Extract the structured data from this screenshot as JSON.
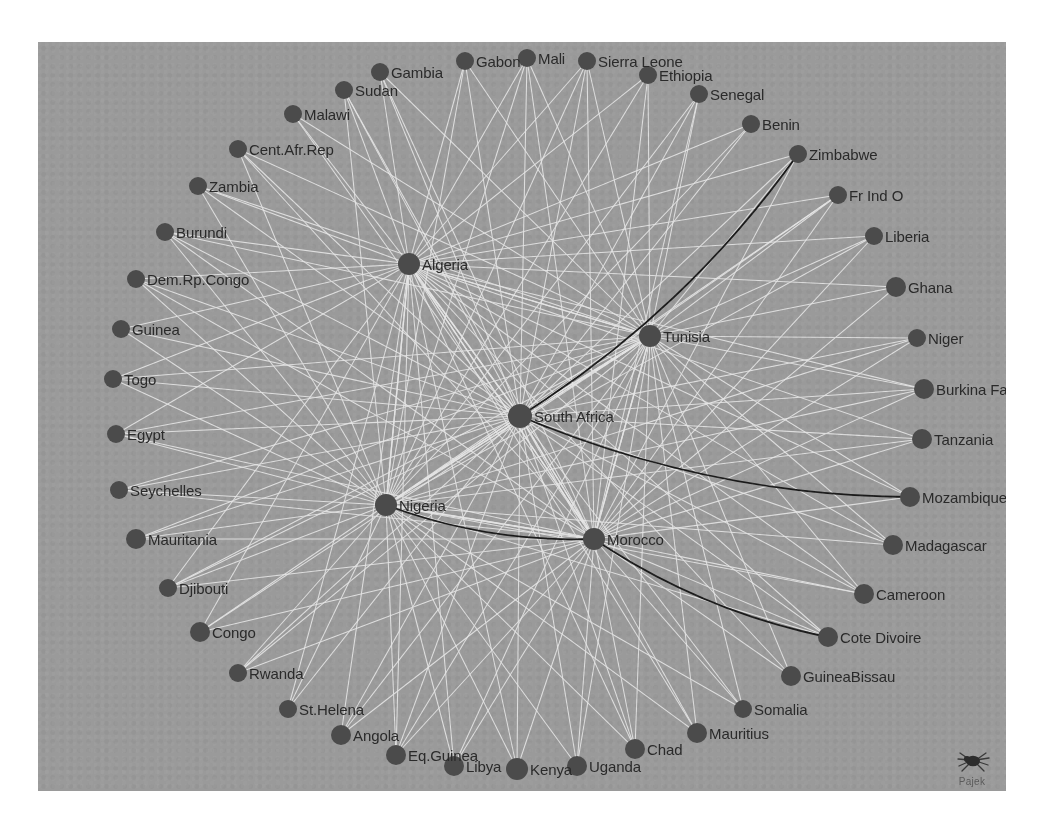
{
  "figure": {
    "kind": "network-graph",
    "software_watermark": "Pajek",
    "background_color": "#9a9a9a",
    "node_color": "#4b4b4b",
    "edge_color": "#e8e8e8",
    "highlight_edge_color": "#1a1a1a",
    "label_color": "#2a2a2a",
    "panel": {
      "x": 38,
      "y": 42,
      "width": 968,
      "height": 749
    }
  },
  "chart_data": {
    "type": "scatter",
    "title": "",
    "xlabel": "",
    "ylabel": "",
    "nodes": [
      {
        "label": "Gambia",
        "x": 342,
        "y": 30,
        "r": 9,
        "label_side": "right"
      },
      {
        "label": "Gabon",
        "x": 427,
        "y": 19,
        "r": 9,
        "label_side": "right"
      },
      {
        "label": "Mali",
        "x": 489,
        "y": 16,
        "r": 9,
        "label_side": "right"
      },
      {
        "label": "Sierra Leone",
        "x": 549,
        "y": 19,
        "r": 9,
        "label_side": "right"
      },
      {
        "label": "Ethiopia",
        "x": 610,
        "y": 33,
        "r": 9,
        "label_side": "right"
      },
      {
        "label": "Sudan",
        "x": 306,
        "y": 48,
        "r": 9,
        "label_side": "right"
      },
      {
        "label": "Senegal",
        "x": 661,
        "y": 52,
        "r": 9,
        "label_side": "right"
      },
      {
        "label": "Malawi",
        "x": 255,
        "y": 72,
        "r": 9,
        "label_side": "right"
      },
      {
        "label": "Benin",
        "x": 713,
        "y": 82,
        "r": 9,
        "label_side": "right"
      },
      {
        "label": "Cent.Afr.Rep",
        "x": 200,
        "y": 107,
        "r": 9,
        "label_side": "right"
      },
      {
        "label": "Zimbabwe",
        "x": 760,
        "y": 112,
        "r": 9,
        "label_side": "right"
      },
      {
        "label": "Zambia",
        "x": 160,
        "y": 144,
        "r": 9,
        "label_side": "right"
      },
      {
        "label": "Fr Ind O",
        "x": 800,
        "y": 153,
        "r": 9,
        "label_side": "right"
      },
      {
        "label": "Burundi",
        "x": 127,
        "y": 190,
        "r": 9,
        "label_side": "right"
      },
      {
        "label": "Liberia",
        "x": 836,
        "y": 194,
        "r": 9,
        "label_side": "right"
      },
      {
        "label": "Dem.Rp.Congo",
        "x": 98,
        "y": 237,
        "r": 9,
        "label_side": "right"
      },
      {
        "label": "Algeria",
        "x": 371,
        "y": 222,
        "r": 11,
        "label_side": "right"
      },
      {
        "label": "Ghana",
        "x": 858,
        "y": 245,
        "r": 10,
        "label_side": "right"
      },
      {
        "label": "Guinea",
        "x": 83,
        "y": 287,
        "r": 9,
        "label_side": "right"
      },
      {
        "label": "Niger",
        "x": 879,
        "y": 296,
        "r": 9,
        "label_side": "right"
      },
      {
        "label": "Tunisia",
        "x": 612,
        "y": 294,
        "r": 11,
        "label_side": "right"
      },
      {
        "label": "Togo",
        "x": 75,
        "y": 337,
        "r": 9,
        "label_side": "right"
      },
      {
        "label": "Burkina Faso",
        "x": 886,
        "y": 347,
        "r": 10,
        "label_side": "right"
      },
      {
        "label": "Egypt",
        "x": 78,
        "y": 392,
        "r": 9,
        "label_side": "right"
      },
      {
        "label": "South Africa",
        "x": 482,
        "y": 374,
        "r": 12,
        "label_side": "right"
      },
      {
        "label": "Tanzania",
        "x": 884,
        "y": 397,
        "r": 10,
        "label_side": "right"
      },
      {
        "label": "Seychelles",
        "x": 81,
        "y": 448,
        "r": 9,
        "label_side": "right"
      },
      {
        "label": "Mozambique",
        "x": 872,
        "y": 455,
        "r": 10,
        "label_side": "right"
      },
      {
        "label": "Nigeria",
        "x": 348,
        "y": 463,
        "r": 11,
        "label_side": "right"
      },
      {
        "label": "Mauritania",
        "x": 98,
        "y": 497,
        "r": 10,
        "label_side": "right"
      },
      {
        "label": "Morocco",
        "x": 556,
        "y": 497,
        "r": 11,
        "label_side": "right"
      },
      {
        "label": "Madagascar",
        "x": 855,
        "y": 503,
        "r": 10,
        "label_side": "right"
      },
      {
        "label": "Djibouti",
        "x": 130,
        "y": 546,
        "r": 9,
        "label_side": "right"
      },
      {
        "label": "Cameroon",
        "x": 826,
        "y": 552,
        "r": 10,
        "label_side": "right"
      },
      {
        "label": "Congo",
        "x": 162,
        "y": 590,
        "r": 10,
        "label_side": "right"
      },
      {
        "label": "Cote Divoire",
        "x": 790,
        "y": 595,
        "r": 10,
        "label_side": "right"
      },
      {
        "label": "Rwanda",
        "x": 200,
        "y": 631,
        "r": 9,
        "label_side": "right"
      },
      {
        "label": "GuineaBissau",
        "x": 753,
        "y": 634,
        "r": 10,
        "label_side": "right"
      },
      {
        "label": "St.Helena",
        "x": 250,
        "y": 667,
        "r": 9,
        "label_side": "right"
      },
      {
        "label": "Somalia",
        "x": 705,
        "y": 667,
        "r": 9,
        "label_side": "right"
      },
      {
        "label": "Angola",
        "x": 303,
        "y": 693,
        "r": 10,
        "label_side": "right"
      },
      {
        "label": "Mauritius",
        "x": 659,
        "y": 691,
        "r": 10,
        "label_side": "right"
      },
      {
        "label": "Eq.Guinea",
        "x": 358,
        "y": 713,
        "r": 10,
        "label_side": "right"
      },
      {
        "label": "Chad",
        "x": 597,
        "y": 707,
        "r": 10,
        "label_side": "right"
      },
      {
        "label": "Libya",
        "x": 416,
        "y": 724,
        "r": 10,
        "label_side": "right"
      },
      {
        "label": "Kenya",
        "x": 479,
        "y": 727,
        "r": 11,
        "label_side": "right"
      },
      {
        "label": "Uganda",
        "x": 539,
        "y": 724,
        "r": 10,
        "label_side": "right"
      }
    ],
    "hubs": [
      "South Africa",
      "Tunisia",
      "Algeria",
      "Nigeria",
      "Morocco"
    ],
    "highlight_paths": [
      {
        "from": "South Africa",
        "to": "Zimbabwe",
        "style": "curve-dark"
      },
      {
        "from": "South Africa",
        "to": "Mozambique",
        "style": "curve-dark"
      },
      {
        "from": "Nigeria",
        "to": "Morocco",
        "style": "curve-dark"
      },
      {
        "from": "Morocco",
        "to": "Cote Divoire",
        "style": "curve-dark"
      }
    ]
  },
  "watermark": {
    "text": "Pajek"
  }
}
